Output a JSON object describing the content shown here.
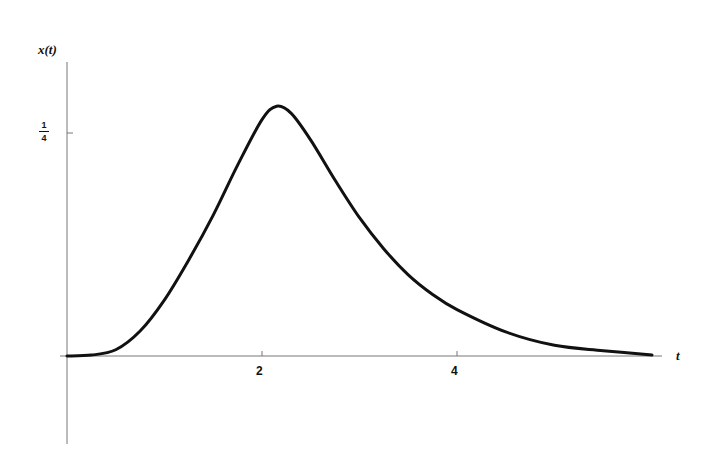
{
  "chart_data": {
    "type": "line",
    "title": "",
    "xlabel": "t",
    "ylabel": "x(t)",
    "xlim": [
      -0.1,
      6.3
    ],
    "ylim": [
      -0.11,
      0.33
    ],
    "grid": false,
    "legend": null,
    "x_ticks": [
      {
        "value": 2,
        "label": "2"
      },
      {
        "value": 4,
        "label": "4"
      }
    ],
    "y_ticks": [
      {
        "value": 0.25,
        "label": "1/4",
        "numerator": "1",
        "denominator": "4"
      }
    ],
    "series": [
      {
        "name": "x(t)",
        "color": "#111111",
        "x": [
          0,
          0.25,
          0.5,
          0.75,
          1.0,
          1.25,
          1.5,
          1.75,
          2.0,
          2.15,
          2.3,
          2.5,
          2.75,
          3.0,
          3.25,
          3.5,
          3.75,
          4.0,
          4.5,
          5.0,
          5.5,
          6.0
        ],
        "y": [
          0,
          0.001,
          0.007,
          0.028,
          0.063,
          0.108,
          0.158,
          0.214,
          0.265,
          0.28,
          0.272,
          0.242,
          0.197,
          0.155,
          0.12,
          0.091,
          0.069,
          0.052,
          0.027,
          0.012,
          0.006,
          0.001
        ]
      }
    ]
  }
}
